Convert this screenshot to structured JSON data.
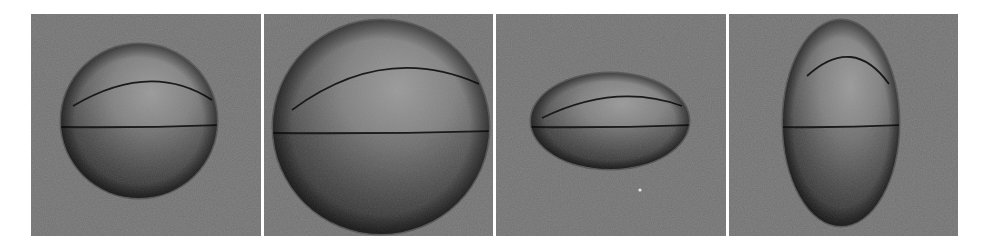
{
  "figure": {
    "background_color": "#ffffff",
    "panel_color": "#6f6f6f",
    "seam_color": "#1a1a1a",
    "panels": [
      {
        "id": "panel-1",
        "shape": "sphere",
        "x": 31,
        "width": 230,
        "center": [
          108,
          107
        ],
        "rx": 78,
        "ry": 77,
        "equator_y": 112,
        "seam_path": "M 42 92 Q 120 46 181 86"
      },
      {
        "id": "panel-2",
        "shape": "large-sphere",
        "x": 264,
        "width": 229,
        "center": [
          117,
          113
        ],
        "rx": 108,
        "ry": 107,
        "equator_y": 118,
        "seam_path": "M 28 96 Q 120 28 215 70"
      },
      {
        "id": "panel-3",
        "shape": "horizontal-ellipsoid",
        "x": 496,
        "width": 230,
        "center": [
          114,
          107
        ],
        "rx": 79,
        "ry": 48,
        "equator_y": 112,
        "seam_path": "M 46 104 Q 120 68 186 92",
        "artifact_dot": [
          144,
          176
        ]
      },
      {
        "id": "panel-4",
        "shape": "vertical-ellipsoid",
        "x": 729,
        "width": 229,
        "center": [
          112,
          109
        ],
        "rx": 58,
        "ry": 103,
        "equator_y": 112,
        "seam_path": "M 78 62 Q 124 20 160 70"
      }
    ]
  }
}
